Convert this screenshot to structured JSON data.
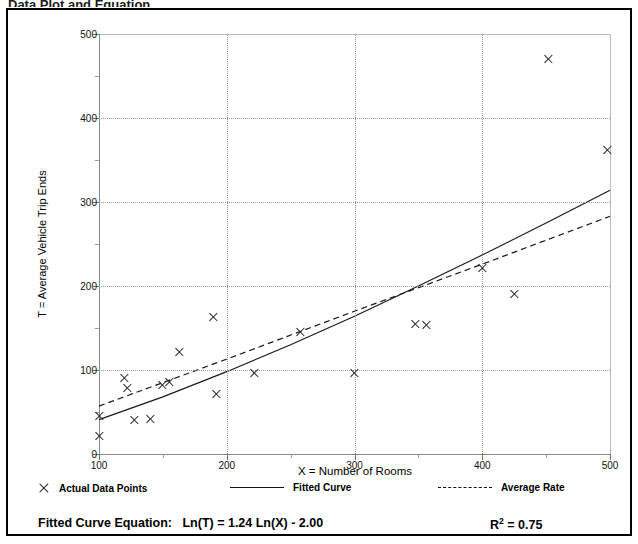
{
  "header": {
    "clipped_title": "Data Plot and Equation"
  },
  "chart_data": {
    "type": "scatter",
    "title": "",
    "xlabel": "X = Number of Rooms",
    "ylabel": "T = Average Vehicle Trip Ends",
    "xlim": [
      100,
      500
    ],
    "ylim": [
      0,
      500
    ],
    "xticks": [
      100,
      200,
      300,
      400,
      500
    ],
    "yticks": [
      0,
      100,
      200,
      300,
      400,
      500
    ],
    "xticks_minor": [
      150,
      250,
      350,
      450
    ],
    "yticks_minor": [
      50,
      150,
      250,
      350,
      450
    ],
    "grid": true,
    "grid_style": "dotted",
    "legend_position": "below-axes",
    "series": [
      {
        "name": "Actual Data Points",
        "type": "scatter",
        "marker": "x",
        "points": [
          [
            100,
            45
          ],
          [
            100,
            22
          ],
          [
            120,
            90
          ],
          [
            122,
            78
          ],
          [
            128,
            40
          ],
          [
            140,
            42
          ],
          [
            150,
            82
          ],
          [
            155,
            86
          ],
          [
            163,
            122
          ],
          [
            190,
            163
          ],
          [
            192,
            72
          ],
          [
            222,
            97
          ],
          [
            258,
            145
          ],
          [
            300,
            97
          ],
          [
            348,
            155
          ],
          [
            356,
            154
          ],
          [
            400,
            222
          ],
          [
            425,
            190
          ],
          [
            452,
            470
          ],
          [
            498,
            362
          ]
        ]
      },
      {
        "name": "Fitted Curve",
        "type": "line",
        "style": "solid",
        "equation": "Ln(T) = 1.24 Ln(X) - 2.00",
        "points": [
          [
            100,
            41
          ],
          [
            150,
            68
          ],
          [
            200,
            98
          ],
          [
            250,
            130
          ],
          [
            300,
            164
          ],
          [
            350,
            200
          ],
          [
            400,
            237
          ],
          [
            450,
            275
          ],
          [
            500,
            314
          ]
        ]
      },
      {
        "name": "Average Rate",
        "type": "line",
        "style": "dashed",
        "points": [
          [
            100,
            57
          ],
          [
            200,
            113
          ],
          [
            300,
            170
          ],
          [
            400,
            226
          ],
          [
            500,
            283
          ]
        ]
      }
    ],
    "annotations": {
      "equation_label": "Fitted Curve Equation:",
      "equation_value": "Ln(T) = 1.24 Ln(X) - 2.00",
      "r_squared_symbol": "R",
      "r_squared_exponent": "2",
      "r_squared_value": "= 0.75"
    }
  },
  "legend": {
    "items": [
      {
        "label": "Actual Data Points",
        "marker": "x-marker"
      },
      {
        "label": "Fitted Curve",
        "marker": "solid-line"
      },
      {
        "label": "Average Rate",
        "marker": "dashed-line"
      }
    ]
  },
  "colors": {
    "ink": "#000000",
    "axis": "#8a8a8a",
    "grid": "#9a9a9a"
  }
}
